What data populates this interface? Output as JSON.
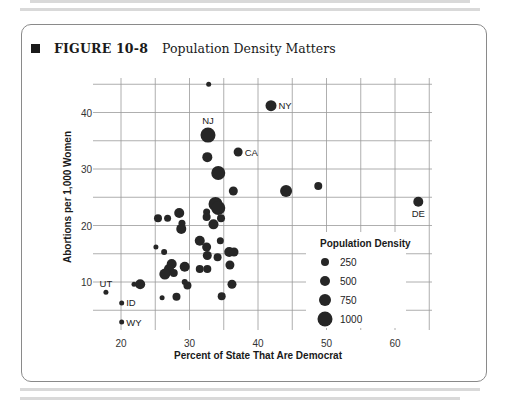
{
  "figure": {
    "number": "FIGURE 10-8",
    "title": "Population Density Matters"
  },
  "chart_data": {
    "type": "scatter",
    "title": "Population Density Matters",
    "xlabel": "Percent of State That Are Democrat",
    "ylabel": "Abortions per 1,000 Women",
    "xlim": [
      15,
      65
    ],
    "ylim": [
      5,
      45
    ],
    "xticks": [
      20,
      30,
      40,
      50,
      60
    ],
    "yticks": [
      10,
      20,
      30,
      40
    ],
    "grid": true,
    "size_variable": "Population Density",
    "legend": {
      "title": "Population Density",
      "position": "lower right inside",
      "entries": [
        {
          "label": "250",
          "size": 250
        },
        {
          "label": "500",
          "size": 500
        },
        {
          "label": "750",
          "size": 750
        },
        {
          "label": "1000",
          "size": 1000
        }
      ]
    },
    "points": [
      {
        "x": 32.8,
        "y": 45.0,
        "r": 2.5,
        "label": ""
      },
      {
        "x": 41.9,
        "y": 41.2,
        "r": 5.5,
        "label": "NY"
      },
      {
        "x": 32.7,
        "y": 36.0,
        "r": 7.5,
        "label": "NJ"
      },
      {
        "x": 32.6,
        "y": 32.1,
        "r": 5,
        "label": ""
      },
      {
        "x": 37.1,
        "y": 33.0,
        "r": 4.5,
        "label": "CA"
      },
      {
        "x": 34.2,
        "y": 29.3,
        "r": 7,
        "label": ""
      },
      {
        "x": 36.4,
        "y": 26.1,
        "r": 4.5,
        "label": ""
      },
      {
        "x": 44.1,
        "y": 26.1,
        "r": 6,
        "label": ""
      },
      {
        "x": 48.8,
        "y": 27.0,
        "r": 4,
        "label": ""
      },
      {
        "x": 63.4,
        "y": 24.2,
        "r": 5,
        "label": "DE"
      },
      {
        "x": 33.8,
        "y": 23.8,
        "r": 7,
        "label": ""
      },
      {
        "x": 34.2,
        "y": 23.1,
        "r": 7,
        "label": ""
      },
      {
        "x": 32.5,
        "y": 22.4,
        "r": 3.5,
        "label": ""
      },
      {
        "x": 32.5,
        "y": 21.5,
        "r": 4,
        "label": ""
      },
      {
        "x": 34.6,
        "y": 21.3,
        "r": 4,
        "label": ""
      },
      {
        "x": 25.4,
        "y": 21.3,
        "r": 4,
        "label": ""
      },
      {
        "x": 26.8,
        "y": 21.3,
        "r": 3.5,
        "label": ""
      },
      {
        "x": 28.5,
        "y": 22.2,
        "r": 5,
        "label": ""
      },
      {
        "x": 28.9,
        "y": 20.4,
        "r": 3.5,
        "label": ""
      },
      {
        "x": 28.8,
        "y": 19.4,
        "r": 5,
        "label": ""
      },
      {
        "x": 33.5,
        "y": 20.2,
        "r": 5,
        "label": ""
      },
      {
        "x": 31.5,
        "y": 17.3,
        "r": 5,
        "label": ""
      },
      {
        "x": 34.5,
        "y": 17.3,
        "r": 3.5,
        "label": ""
      },
      {
        "x": 25.1,
        "y": 16.2,
        "r": 2.5,
        "label": ""
      },
      {
        "x": 26.3,
        "y": 15.3,
        "r": 3,
        "label": ""
      },
      {
        "x": 32.5,
        "y": 16.2,
        "r": 4.5,
        "label": ""
      },
      {
        "x": 32.6,
        "y": 14.7,
        "r": 4.5,
        "label": ""
      },
      {
        "x": 35.8,
        "y": 15.3,
        "r": 5,
        "label": ""
      },
      {
        "x": 36.5,
        "y": 15.3,
        "r": 4.5,
        "label": ""
      },
      {
        "x": 34.1,
        "y": 14.4,
        "r": 4,
        "label": ""
      },
      {
        "x": 27.4,
        "y": 13.2,
        "r": 5,
        "label": ""
      },
      {
        "x": 27.0,
        "y": 12.3,
        "r": 5,
        "label": ""
      },
      {
        "x": 26.4,
        "y": 11.4,
        "r": 5.5,
        "label": ""
      },
      {
        "x": 27.7,
        "y": 11.6,
        "r": 4,
        "label": ""
      },
      {
        "x": 29.3,
        "y": 12.7,
        "r": 5,
        "label": ""
      },
      {
        "x": 31.5,
        "y": 12.3,
        "r": 4,
        "label": ""
      },
      {
        "x": 32.6,
        "y": 12.3,
        "r": 4,
        "label": ""
      },
      {
        "x": 35.9,
        "y": 13.0,
        "r": 4.5,
        "label": ""
      },
      {
        "x": 22.8,
        "y": 9.6,
        "r": 5,
        "label": ""
      },
      {
        "x": 21.9,
        "y": 9.6,
        "r": 2.5,
        "label": ""
      },
      {
        "x": 29.3,
        "y": 10.0,
        "r": 3,
        "label": ""
      },
      {
        "x": 29.7,
        "y": 9.4,
        "r": 4,
        "label": ""
      },
      {
        "x": 36.2,
        "y": 9.6,
        "r": 4.5,
        "label": ""
      },
      {
        "x": 34.7,
        "y": 7.5,
        "r": 4,
        "label": ""
      },
      {
        "x": 26.0,
        "y": 7.2,
        "r": 2.5,
        "label": ""
      },
      {
        "x": 28.1,
        "y": 7.4,
        "r": 4,
        "label": ""
      },
      {
        "x": 17.8,
        "y": 8.2,
        "r": 2.5,
        "label": "UT"
      },
      {
        "x": 20.1,
        "y": 6.3,
        "r": 2.5,
        "label": "ID"
      },
      {
        "x": 20.1,
        "y": 2.9,
        "r": 2.5,
        "label": "WY"
      }
    ]
  }
}
